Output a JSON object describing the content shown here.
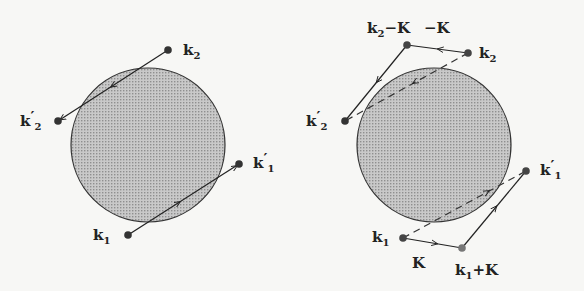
{
  "colors": {
    "background": "#f7f7f5",
    "sphere_fill": "#bdbdbd",
    "ink": "#222222"
  },
  "panels": [
    {
      "name": "normal-process",
      "points": [
        {
          "id": "k2",
          "label": "k",
          "sub": "2",
          "prime": ""
        },
        {
          "id": "k2p",
          "label": "k",
          "sub": "2",
          "prime": "′"
        },
        {
          "id": "k1p",
          "label": "k",
          "sub": "1",
          "prime": "′"
        },
        {
          "id": "k1",
          "label": "k",
          "sub": "1",
          "prime": ""
        }
      ]
    },
    {
      "name": "umklapp-process",
      "points": [
        {
          "id": "k2mK",
          "label": "k",
          "sub": "2",
          "suffix": "−K"
        },
        {
          "id": "mK",
          "label": "−K"
        },
        {
          "id": "k2",
          "label": "k",
          "sub": "2"
        },
        {
          "id": "k2p",
          "label": "k",
          "sub": "2",
          "prime": "′"
        },
        {
          "id": "k1p",
          "label": "k",
          "sub": "1",
          "prime": "′"
        },
        {
          "id": "k1",
          "label": "k",
          "sub": "1"
        },
        {
          "id": "K",
          "label": "K"
        },
        {
          "id": "k1pK",
          "label": "k",
          "sub": "1",
          "suffix": "+K"
        }
      ]
    }
  ]
}
